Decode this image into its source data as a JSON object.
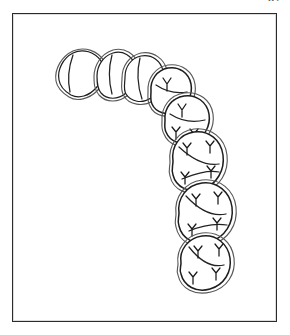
{
  "page": {
    "page_number": "67",
    "background_color": "#ffffff",
    "ink_color": "#1d1d1d",
    "sketch_color": "#585858"
  },
  "figure": {
    "name": "dental-arch-occlusal-view",
    "frame": {
      "x": 12,
      "y": 13,
      "width": 265,
      "height": 309,
      "border_color": "#2b2b2b"
    },
    "teeth": [
      {
        "id": "tooth-1",
        "name": "central-incisor",
        "type": "incisor",
        "center": [
          72,
          62
        ],
        "outline": "M 46,66 C 44,56 50,44 60,39 C 70,34 82,38 88,47 C 93,55 90,66 83,74 C 76,82 66,85 58,81 C 51,77 47,72 46,66 Z",
        "sketch": "M 43,67 C 41,55 49,42 60,37 C 72,32 85,37 91,47 C 96,57 92,68 84,77 C 76,85 64,88 56,83 C 48,78 44,73 43,67 Z",
        "grooves": [
          "M 60,41 C 56,52 54,64 57,78"
        ],
        "cusps": []
      },
      {
        "id": "tooth-2",
        "name": "lateral-incisor",
        "type": "incisor",
        "center": [
          101,
          63
        ],
        "outline": "M 84,62 C 84,52 90,42 100,39 C 110,36 119,42 122,51 C 125,61 121,72 113,79 C 105,86 94,86 88,79 C 84,74 84,68 84,62 Z",
        "sketch": "M 81,63 C 81,51 88,40 100,36 C 112,33 122,40 126,51 C 129,62 124,74 115,81 C 106,89 93,89 86,81 C 81,75 81,69 81,63 Z",
        "grooves": [
          "M 99,41 C 96,52 95,65 99,80"
        ],
        "cusps": []
      },
      {
        "id": "tooth-3",
        "name": "canine",
        "type": "canine",
        "center": [
          128,
          66
        ],
        "outline": "M 112,63 C 112,53 118,44 128,42 C 139,40 148,47 150,57 C 152,67 147,78 138,84 C 129,90 118,88 113,80 C 110,75 112,69 112,63 Z",
        "sketch": "M 109,64 C 109,52 116,42 128,39 C 141,37 151,45 154,56 C 156,68 150,80 140,87 C 130,93 116,91 111,82 C 107,76 109,70 109,64 Z",
        "grooves": [
          "M 127,44 C 124,56 124,70 129,85"
        ],
        "cusps": []
      },
      {
        "id": "tooth-4",
        "name": "first-premolar",
        "type": "premolar",
        "center": [
          154,
          78
        ],
        "outline": "M 138,77 C 137,66 144,56 155,54 C 166,52 176,59 178,70 C 180,81 174,92 164,97 C 154,102 143,99 139,90 C 137,86 138,81 138,77 Z",
        "sketch": "M 135,78 C 134,65 142,53 155,51 C 169,49 180,58 182,70 C 184,83 177,95 166,100 C 155,105 141,102 137,92 C 134,87 135,83 135,78 Z",
        "grooves": [
          "M 143,71 C 152,77 163,80 174,78"
        ],
        "cusps": [
          "M 150,64 L 154,70 M 158,64 L 154,70 M 154,70 L 154,77",
          "M 161,86 L 165,91 M 169,86 L 165,91 M 165,91 L 165,97"
        ]
      },
      {
        "id": "tooth-5",
        "name": "second-premolar",
        "type": "premolar",
        "center": [
          170,
          107
        ],
        "outline": "M 152,106 C 151,94 159,84 171,82 C 183,80 194,88 196,100 C 198,112 191,124 180,128 C 169,132 157,128 153,118 C 151,114 152,110 152,106 Z",
        "sketch": "M 149,107 C 148,93 157,81 171,79 C 186,77 198,86 200,100 C 202,114 194,127 182,131 C 170,136 155,131 151,120 C 148,115 149,111 149,107 Z",
        "grooves": [
          "M 157,100 C 168,107 180,109 192,106"
        ],
        "cusps": [
          "M 165,90 L 169,96 M 173,90 L 169,96 M 169,96 L 169,103",
          "M 177,115 L 181,120 M 185,115 L 181,120 M 181,120 L 181,127",
          "M 159,113 L 163,118 M 167,113 L 163,118 M 163,118 L 163,125"
        ]
      },
      {
        "id": "tooth-6",
        "name": "first-molar",
        "type": "molar",
        "center": [
          182,
          148
        ],
        "outline": "M 160,147 C 158,132 167,120 181,118 C 196,116 208,126 210,141 C 212,156 204,170 190,175 C 176,180 163,173 160,161 C 158,156 160,152 160,147 Z",
        "sketch": "M 157,148 C 155,131 165,117 181,115 C 198,113 212,124 214,141 C 216,158 207,173 191,178 C 175,183 160,176 157,162 C 155,157 157,153 157,148 Z",
        "grooves": [
          "M 166,133 C 180,146 194,152 206,150",
          "M 169,165 C 182,160 194,156 206,158"
        ],
        "cusps": [
          "M 170,129 L 174,134 M 178,129 L 174,134 M 174,134 L 174,141",
          "M 193,127 L 197,132 M 201,127 L 197,132 M 197,132 L 197,139",
          "M 168,158 L 172,163 M 176,158 L 172,163 M 172,163 L 172,170",
          "M 194,152 L 198,157 M 202,152 L 198,157 M 198,157 L 198,164"
        ]
      },
      {
        "id": "tooth-7",
        "name": "second-molar",
        "type": "molar",
        "center": [
          189,
          200
        ],
        "outline": "M 166,199 C 164,184 174,171 189,169 C 204,167 217,178 219,193 C 221,209 212,223 197,228 C 182,232 169,225 166,212 C 164,207 166,204 166,199 Z",
        "sketch": "M 163,200 C 161,183 172,168 189,166 C 207,164 221,176 223,193 C 225,211 215,226 198,231 C 181,236 166,228 163,213 C 161,208 163,205 163,200 Z",
        "grooves": [
          "M 173,182 C 186,196 199,203 213,200",
          "M 176,217 C 188,212 201,209 214,211"
        ],
        "cusps": [
          "M 179,180 L 183,185 M 187,180 L 183,185 M 183,185 L 183,192",
          "M 201,178 L 205,183 M 209,178 L 205,183 M 205,183 L 205,190",
          "M 175,210 L 179,215 M 183,210 L 179,215 M 179,215 L 179,222",
          "M 200,204 L 204,209 M 208,204 L 204,209 M 204,209 L 204,216"
        ]
      },
      {
        "id": "tooth-8",
        "name": "third-molar",
        "type": "molar",
        "center": [
          188,
          250
        ],
        "outline": "M 168,249 C 166,236 175,224 189,222 C 203,220 215,230 217,244 C 219,258 211,271 197,275 C 183,279 171,272 168,260 C 166,256 168,253 168,249 Z",
        "sketch": "M 165,250 C 163,235 173,221 189,219 C 206,217 219,228 221,244 C 223,260 214,274 198,278 C 182,282 168,275 165,261 C 163,257 165,254 165,250 Z",
        "grooves": [
          "M 176,233 C 187,247 199,254 211,251"
        ],
        "cusps": [
          "M 181,232 L 185,237 M 189,232 L 185,237 M 185,237 L 185,244",
          "M 202,230 L 206,235 M 210,230 L 206,235 M 206,235 L 206,242",
          "M 176,258 L 180,263 M 184,258 L 180,263 M 180,263 L 180,270",
          "M 199,254 L 203,259 M 207,254 L 203,259 M 203,259 L 203,266"
        ]
      }
    ]
  }
}
